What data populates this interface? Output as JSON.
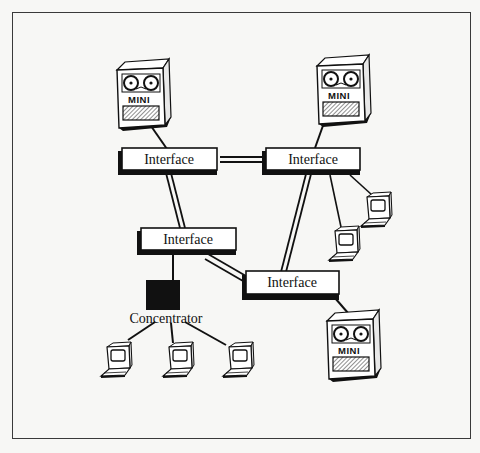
{
  "figure": {
    "type": "network-diagram"
  },
  "nodes": {
    "minis": [
      {
        "id": "mini-top-left",
        "label": "MINI"
      },
      {
        "id": "mini-top-right",
        "label": "MINI"
      },
      {
        "id": "mini-bottom-right",
        "label": "MINI"
      }
    ],
    "interfaces": [
      {
        "id": "interface-top-left",
        "label": "Interface"
      },
      {
        "id": "interface-top-right",
        "label": "Interface"
      },
      {
        "id": "interface-middle-left",
        "label": "Interface"
      },
      {
        "id": "interface-bottom-right",
        "label": "Interface"
      }
    ],
    "concentrator": {
      "id": "concentrator",
      "label": "Concentrator"
    },
    "terminals": [
      {
        "id": "terminal-right-upper"
      },
      {
        "id": "terminal-right-lower"
      },
      {
        "id": "terminal-bottom-1"
      },
      {
        "id": "terminal-bottom-2"
      },
      {
        "id": "terminal-bottom-3"
      }
    ]
  },
  "edges": [
    {
      "from": "mini-top-left",
      "to": "interface-top-left",
      "style": "single"
    },
    {
      "from": "mini-top-right",
      "to": "interface-top-right",
      "style": "single"
    },
    {
      "from": "interface-top-left",
      "to": "interface-top-right",
      "style": "double"
    },
    {
      "from": "interface-top-left",
      "to": "interface-middle-left",
      "style": "double"
    },
    {
      "from": "interface-top-right",
      "to": "interface-bottom-right",
      "style": "double"
    },
    {
      "from": "interface-middle-left",
      "to": "interface-bottom-right",
      "style": "double"
    },
    {
      "from": "interface-top-right",
      "to": "terminal-right-upper",
      "style": "single"
    },
    {
      "from": "interface-top-right",
      "to": "terminal-right-lower",
      "style": "single"
    },
    {
      "from": "interface-middle-left",
      "to": "concentrator",
      "style": "single"
    },
    {
      "from": "interface-bottom-right",
      "to": "mini-bottom-right",
      "style": "single"
    },
    {
      "from": "concentrator",
      "to": "terminal-bottom-1",
      "style": "single"
    },
    {
      "from": "concentrator",
      "to": "terminal-bottom-2",
      "style": "single"
    },
    {
      "from": "concentrator",
      "to": "terminal-bottom-3",
      "style": "single"
    }
  ],
  "colors": {
    "ink": "#111111",
    "paper": "#f7f7f5",
    "frame": "#3a3a3a"
  }
}
